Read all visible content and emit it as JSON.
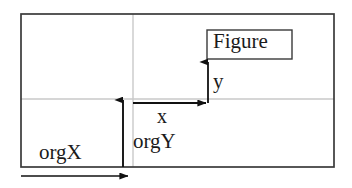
{
  "diagram": {
    "colors": {
      "outline": "#3a3a3a",
      "inner_guide": "#c9c9c9",
      "arrow": "#111111",
      "text": "#1b1b1b",
      "background": "#ffffff"
    },
    "outer_frame": {
      "name": "outer-frame",
      "x": 21,
      "y": 14,
      "width": 313,
      "height": 153
    },
    "guides": {
      "vertical_guide_x": 133,
      "horizontal_guide_y": 99
    },
    "figure_box": {
      "label": "Figure",
      "x": 207,
      "y": 30,
      "width": 85,
      "height": 29
    },
    "origin": {
      "x": 208,
      "y": 103
    },
    "axes": [
      {
        "label": "x",
        "direction": "horizontal-right",
        "from_x": 133,
        "to_x": 208,
        "y": 103
      },
      {
        "label": "y",
        "direction": "vertical-up",
        "x": 208,
        "from_y": 103,
        "to_y": 60
      }
    ],
    "offsets": [
      {
        "label": "orgX",
        "direction": "horizontal-right",
        "from_x": 21,
        "to_x": 130,
        "y": 176
      },
      {
        "label": "orgY",
        "direction": "vertical-up",
        "x": 123,
        "from_y": 167,
        "to_y": 98
      }
    ],
    "labels": {
      "figure": "Figure",
      "x_axis": "x",
      "y_axis": "y",
      "org_x": "orgX",
      "org_y": "orgY"
    }
  }
}
